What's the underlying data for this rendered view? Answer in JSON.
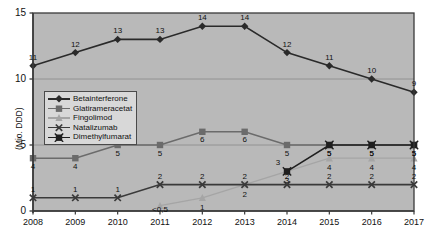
{
  "chart_data": {
    "type": "line",
    "title": "",
    "xlabel": "",
    "ylabel": "(Mio. DDD)",
    "ylim": [
      0,
      15
    ],
    "yticks": [
      "0",
      "5",
      "10",
      "15"
    ],
    "grid": true,
    "legend_position": "inside-left",
    "categories": [
      "2008",
      "2009",
      "2010",
      "2011",
      "2012",
      "2013",
      "2014",
      "2015",
      "2016",
      "2017"
    ],
    "series": [
      {
        "name": "Betainterferone",
        "marker": "diamond",
        "color": "#2a2a2a",
        "values": [
          11,
          12,
          13,
          13,
          14,
          14,
          12,
          11,
          10,
          9
        ],
        "labels": [
          "11",
          "12",
          "13",
          "13",
          "14",
          "14",
          "12",
          "11",
          "10",
          "9"
        ]
      },
      {
        "name": "Glatirameracetat",
        "marker": "square",
        "color": "#6b6b6b",
        "values": [
          4,
          4,
          5,
          5,
          6,
          6,
          5,
          5,
          5,
          5
        ],
        "labels": [
          "4",
          "4",
          "5",
          "5",
          "6",
          "6",
          "5",
          "5",
          "5",
          "5"
        ]
      },
      {
        "name": "Fingolimod",
        "marker": "triangle",
        "color": "#a5a5a5",
        "values": [
          null,
          null,
          null,
          0.4,
          1,
          2,
          3,
          4,
          4,
          4
        ],
        "labels": [
          "",
          "",
          "",
          "<0,5",
          "1",
          "2",
          "3",
          "4",
          "4",
          "4"
        ]
      },
      {
        "name": "Natalizumab",
        "marker": "x",
        "color": "#3a3a3a",
        "values": [
          1,
          1,
          1,
          2,
          2,
          2,
          2,
          2,
          2,
          2
        ],
        "labels": [
          "1",
          "1",
          "1",
          "2",
          "2",
          "2",
          "2",
          "2",
          "2",
          "2"
        ]
      },
      {
        "name": "Dimethylfumarat",
        "marker": "square-x",
        "color": "#1f1f1f",
        "values": [
          null,
          null,
          null,
          null,
          null,
          null,
          3,
          5,
          5,
          5
        ],
        "labels": [
          "",
          "",
          "",
          "",
          "",
          "",
          "3",
          "5",
          "5",
          "5"
        ]
      }
    ]
  },
  "colors": {
    "plot_background": "#b9b9b9",
    "plot_border": "#3a3a3a",
    "grid": "#8f8f8f",
    "page_background": "#ffffff",
    "legend_background": "#d8d8d8",
    "legend_border": "#4a4a4a",
    "text": "#111111"
  }
}
